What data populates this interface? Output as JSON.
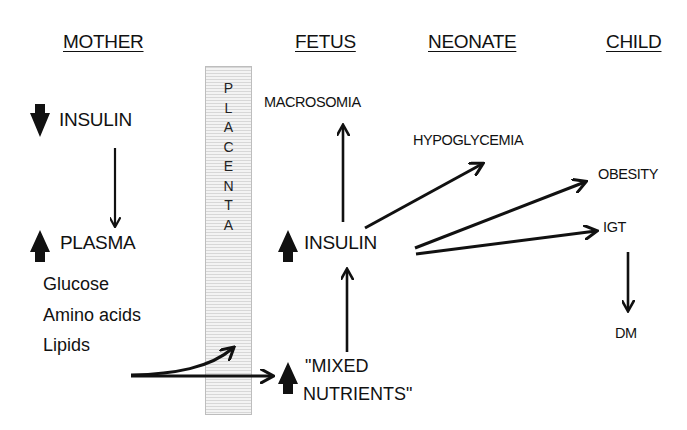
{
  "headers": {
    "mother": "MOTHER",
    "fetus": "FETUS",
    "neonate": "NEONATE",
    "child": "CHILD"
  },
  "placenta": {
    "letters": [
      "P",
      "L",
      "A",
      "C",
      "E",
      "N",
      "T",
      "A"
    ],
    "fill_color": "#e6e6e6"
  },
  "mother": {
    "insulin": {
      "label": "INSULIN",
      "direction": "down"
    },
    "plasma": {
      "label": "PLASMA",
      "direction": "up"
    },
    "nutrients": [
      "Glucose",
      "Amino acids",
      "Lipids"
    ]
  },
  "fetus": {
    "macrosomia": "MACROSOMIA",
    "insulin": {
      "label": "INSULIN",
      "direction": "up"
    },
    "mixed_nutrients": {
      "line1": "\"MIXED",
      "line2": "NUTRIENTS\"",
      "direction": "up"
    }
  },
  "neonate": {
    "hypoglycemia": "HYPOGLYCEMIA"
  },
  "child": {
    "obesity": "OBESITY",
    "igt": "IGT",
    "dm": "DM"
  },
  "edges": [
    {
      "from": "mother.insulin",
      "to": "mother.plasma"
    },
    {
      "from": "mother.nutrients",
      "to": "placenta"
    },
    {
      "from": "mother.nutrients",
      "to": "fetus.mixed_nutrients"
    },
    {
      "from": "fetus.mixed_nutrients",
      "to": "fetus.insulin"
    },
    {
      "from": "fetus.insulin",
      "to": "fetus.macrosomia"
    },
    {
      "from": "fetus.insulin",
      "to": "neonate.hypoglycemia"
    },
    {
      "from": "fetus.insulin",
      "to": "child.obesity"
    },
    {
      "from": "fetus.insulin",
      "to": "child.igt"
    },
    {
      "from": "child.igt",
      "to": "child.dm"
    }
  ]
}
